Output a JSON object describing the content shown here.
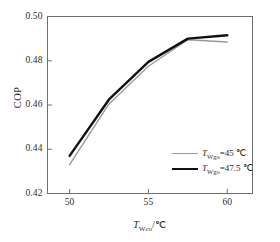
{
  "chart_data": {
    "type": "line",
    "title": "",
    "xlabel": "T_Wco/℃",
    "ylabel": "COP",
    "xlabel_symbol": "T",
    "xlabel_subscript": "Wco",
    "xlabel_unit": "/℃",
    "x": [
      50,
      52.5,
      55,
      57.5,
      60
    ],
    "xlim": [
      48.6,
      61.6
    ],
    "ylim": [
      0.42,
      0.5
    ],
    "xticks": [
      50,
      55,
      60
    ],
    "xtick_labels": [
      "50",
      "55",
      "60"
    ],
    "yticks": [
      0.42,
      0.44,
      0.46,
      0.48,
      0.5
    ],
    "ytick_labels": [
      "0.42",
      "0.44",
      "0.46",
      "0.48",
      "0.50"
    ],
    "grid": false,
    "legend_position": "lower right",
    "series": [
      {
        "name": "T_Wgo=45 ℃",
        "symbol": "T",
        "subscript": "Wgo",
        "value": "=45",
        "unit": "℃",
        "color": "#9a9a9a",
        "width": 1.4,
        "values": [
          0.433,
          0.4605,
          0.4775,
          0.4895,
          0.4885
        ]
      },
      {
        "name": "T_Wgo=47.5 ℃",
        "symbol": "T",
        "subscript": "Wgo",
        "value": "=47.5",
        "unit": "℃",
        "color": "#111111",
        "width": 2.4,
        "values": [
          0.437,
          0.4625,
          0.4795,
          0.49,
          0.4915
        ]
      }
    ]
  },
  "axis": {
    "frame_color": "#6e6e6e",
    "ytick_labels": [
      "0.50",
      "0.48",
      "0.46",
      "0.44",
      "0.42"
    ],
    "xtick_labels": [
      "50",
      "55",
      "60"
    ],
    "ylabel": "COP"
  }
}
